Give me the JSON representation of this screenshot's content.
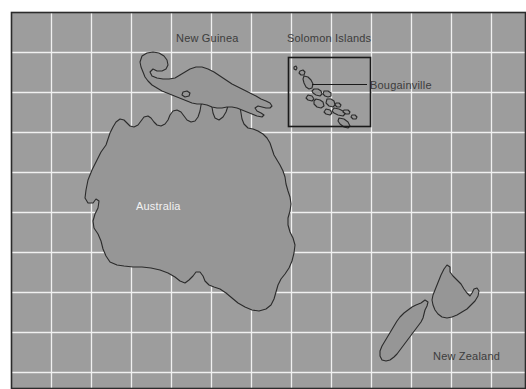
{
  "map": {
    "title": "Oceania region map",
    "canvas": {
      "width": 526,
      "height": 389
    },
    "panel": {
      "x": 11,
      "y": 12,
      "width": 515,
      "height": 377
    },
    "colors": {
      "page_background": "#ffffff",
      "ocean_fill": "#9d9d9d",
      "land_fill": "#969696",
      "land_stroke": "#2b2b2b",
      "grid_line": "#f0f0f0",
      "panel_border": "#2b2b2b",
      "label_dark": "#3c3c3c",
      "label_light": "#f2f2f2",
      "inset_box_stroke": "#1a1a1a",
      "leader_line": "#1a1a1a"
    },
    "grid": {
      "visible": true,
      "line_color": "#f0f0f0",
      "vertical_spacing": 40,
      "horizontal_spacing": 40,
      "vertical_lines": [
        51,
        91,
        131,
        171,
        211,
        251,
        291,
        331,
        371,
        411,
        451,
        491
      ],
      "horizontal_lines": [
        52,
        92,
        132,
        172,
        212,
        252,
        292,
        332,
        372
      ]
    },
    "labels": [
      {
        "id": "new-guinea",
        "text": "New Guinea",
        "x": 176,
        "y": 32,
        "style": "dark"
      },
      {
        "id": "solomon-islands",
        "text": "Solomon Islands",
        "x": 287,
        "y": 32,
        "style": "dark"
      },
      {
        "id": "bougainville",
        "text": "Bougainville",
        "x": 370,
        "y": 79,
        "style": "dark"
      },
      {
        "id": "australia",
        "text": "Australia",
        "x": 136,
        "y": 200,
        "style": "light"
      },
      {
        "id": "new-zealand",
        "text": "New Zealand",
        "x": 433,
        "y": 350,
        "style": "dark"
      }
    ],
    "inset_box": {
      "id": "solomon-islands-inset",
      "x": 288,
      "y": 57,
      "width": 82,
      "height": 69,
      "stroke_width": 1.6
    },
    "leader_line": {
      "id": "bougainville-leader",
      "x1": 312,
      "y1": 84,
      "x2": 367,
      "y2": 84,
      "stroke_width": 1.2
    },
    "landmasses": [
      {
        "id": "australia",
        "name": "Australia",
        "path": "M 106 145 L 101 152 L 97 160 L 92 170 L 88 180 L 86 190 L 85 198 L 88 203 L 93 203 L 96 199 L 99 201 L 98 208 L 95 214 L 93 221 L 94 228 L 98 234 L 101 241 L 103 249 L 106 256 L 110 262 L 117 265 L 124 266 L 133 267 L 142 267 L 151 268 L 160 270 L 168 273 L 175 277 L 180 281 L 185 283 L 189 280 L 193 276 L 196 272 L 200 272 L 203 276 L 205 281 L 209 285 L 214 287 L 220 289 L 226 293 L 232 298 L 238 303 L 245 307 L 252 310 L 259 311 L 266 309 L 271 305 L 274 299 L 276 292 L 278 285 L 281 279 L 285 274 L 289 268 L 292 261 L 294 253 L 295 245 L 293 238 L 290 232 L 288 225 L 288 218 L 290 211 L 291 204 L 290 197 L 288 191 L 286 184 L 285 177 L 283 171 L 280 165 L 277 160 L 274 155 L 272 149 L 270 143 L 267 138 L 263 134 L 258 131 L 253 129 L 248 128 L 244 124 L 242 119 L 241 113 L 240 107 L 238 102 L 234 99 L 230 101 L 228 106 L 226 112 L 223 117 L 219 120 L 215 118 L 213 113 L 212 107 L 210 102 L 207 99 L 203 100 L 201 105 L 200 111 L 198 117 L 195 121 L 191 122 L 187 120 L 184 116 L 181 112 L 177 110 L 173 111 L 170 115 L 168 120 L 165 124 L 161 126 L 157 125 L 154 122 L 151 118 L 148 116 L 144 117 L 141 121 L 138 125 L 134 127 L 130 126 L 127 123 L 124 120 L 120 119 L 116 122 L 113 127 L 110 133 L 108 139 Z"
      },
      {
        "id": "new-guinea",
        "name": "New Guinea",
        "path": "M 142 56 L 147 53 L 153 52 L 159 53 L 164 56 L 167 60 L 168 65 L 166 69 L 162 71 L 157 71 L 153 69 L 150 72 L 152 76 L 157 78 L 163 79 L 169 79 L 175 78 L 180 75 L 185 72 L 190 69 L 196 67 L 202 67 L 208 69 L 214 72 L 220 76 L 226 80 L 232 84 L 238 87 L 244 90 L 250 93 L 256 96 L 261 99 L 266 101 L 270 103 L 272 106 L 270 108 L 266 108 L 262 107 L 258 106 L 255 108 L 257 111 L 261 113 L 264 115 L 262 117 L 257 116 L 252 114 L 247 112 L 242 110 L 237 108 L 232 107 L 227 107 L 222 108 L 217 108 L 212 107 L 207 105 L 202 104 L 197 104 L 192 103 L 187 101 L 182 99 L 177 97 L 172 95 L 167 93 L 162 91 L 157 88 L 152 85 L 148 81 L 145 77 L 143 72 L 141 67 L 140 62 Z"
      },
      {
        "id": "new-guinea-islet",
        "name": "New Guinea islet",
        "path": "M 183 92 L 187 91 L 190 93 L 189 96 L 185 97 L 182 95 Z"
      },
      {
        "id": "new-zealand-north",
        "name": "New Zealand North Island",
        "path": "M 444 269 L 447 265 L 450 267 L 450 272 L 453 276 L 457 280 L 461 284 L 464 289 L 467 293 L 470 296 L 472 293 L 474 289 L 477 288 L 479 291 L 478 296 L 475 301 L 471 305 L 467 309 L 462 312 L 457 315 L 452 317 L 447 318 L 442 317 L 438 314 L 435 310 L 433 305 L 432 300 L 433 295 L 435 290 L 437 285 L 439 280 L 441 275 Z"
      },
      {
        "id": "new-zealand-south",
        "name": "New Zealand South Island",
        "path": "M 421 303 L 425 300 L 428 302 L 427 306 L 425 310 L 424 314 L 423 318 L 421 322 L 418 326 L 415 330 L 412 334 L 409 338 L 406 342 L 403 346 L 400 350 L 397 354 L 394 357 L 390 360 L 386 361 L 382 360 L 380 356 L 380 351 L 382 346 L 385 341 L 388 336 L 391 331 L 394 326 L 397 321 L 400 317 L 404 313 L 408 310 L 412 307 L 416 305 Z"
      },
      {
        "id": "solomon-island-01",
        "name": "Solomon island",
        "path": "M 294 67 L 296 66 L 297 68 L 296 70 L 294 69 Z"
      },
      {
        "id": "solomon-island-02",
        "name": "Solomon island",
        "path": "M 300 71 L 303 70 L 305 72 L 304 75 L 301 75 L 299 73 Z"
      },
      {
        "id": "solomon-island-03",
        "name": "Bougainville",
        "path": "M 304 76 L 308 77 L 311 80 L 313 84 L 312 88 L 309 89 L 306 87 L 304 83 L 303 79 Z"
      },
      {
        "id": "solomon-island-04",
        "name": "Solomon island",
        "path": "M 314 89 L 318 89 L 321 91 L 322 94 L 320 96 L 316 95 L 313 93 L 312 91 Z"
      },
      {
        "id": "solomon-island-05",
        "name": "Solomon island",
        "path": "M 324 91 L 328 91 L 331 93 L 331 96 L 328 97 L 325 96 L 323 94 Z"
      },
      {
        "id": "solomon-island-06",
        "name": "Solomon island",
        "path": "M 308 95 L 312 96 L 314 99 L 312 101 L 308 100 L 306 98 Z"
      },
      {
        "id": "solomon-island-07",
        "name": "Solomon island",
        "path": "M 316 99 L 320 100 L 323 102 L 324 106 L 321 108 L 317 107 L 314 104 L 314 101 Z"
      },
      {
        "id": "solomon-island-08",
        "name": "Solomon island",
        "path": "M 327 99 L 331 99 L 334 101 L 335 105 L 333 107 L 329 106 L 326 103 Z"
      },
      {
        "id": "solomon-island-09",
        "name": "Solomon island",
        "path": "M 336 103 L 339 103 L 341 105 L 340 107 L 337 107 L 335 105 Z"
      },
      {
        "id": "solomon-island-10",
        "name": "Solomon island",
        "path": "M 326 109 L 330 110 L 332 113 L 330 115 L 326 114 L 324 112 Z"
      },
      {
        "id": "solomon-island-11",
        "name": "Solomon island",
        "path": "M 334 108 L 339 109 L 343 111 L 345 114 L 343 116 L 338 115 L 334 113 L 332 111 Z"
      },
      {
        "id": "solomon-island-12",
        "name": "Solomon island",
        "path": "M 344 110 L 348 110 L 350 112 L 349 114 L 346 114 L 343 112 Z"
      },
      {
        "id": "solomon-island-13",
        "name": "Solomon island",
        "path": "M 339 118 L 344 119 L 348 122 L 350 126 L 348 128 L 344 127 L 340 124 L 338 121 Z"
      },
      {
        "id": "solomon-island-14",
        "name": "Solomon island",
        "path": "M 352 115 L 355 115 L 357 117 L 356 119 L 353 119 L 351 117 Z"
      }
    ]
  }
}
